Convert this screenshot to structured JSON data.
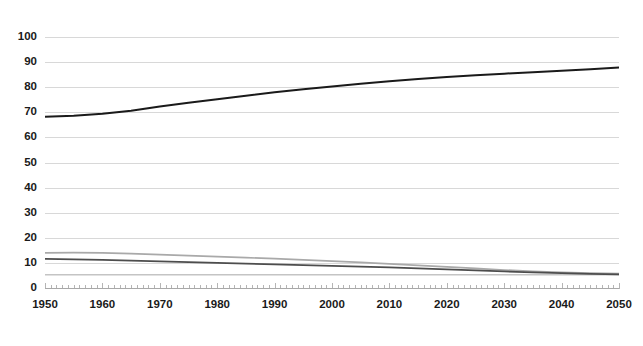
{
  "chart_data": {
    "type": "line",
    "title": "",
    "subtitle": "",
    "xlabel": "",
    "ylabel": "",
    "xlim": [
      1950,
      2050
    ],
    "ylim": [
      0,
      100
    ],
    "ytick_step": 10,
    "grid": true,
    "legend": "none",
    "y_ticks": [
      "0",
      "10",
      "20",
      "30",
      "40",
      "50",
      "60",
      "70",
      "80",
      "90",
      "100"
    ],
    "x_ticks": [
      "1950",
      "1960",
      "1970",
      "1980",
      "1990",
      "2000",
      "2010",
      "2020",
      "2030",
      "2040",
      "2050"
    ],
    "x": [
      1950,
      1955,
      1960,
      1965,
      1970,
      1975,
      1980,
      1985,
      1990,
      1995,
      2000,
      2005,
      2010,
      2015,
      2020,
      2025,
      2030,
      2035,
      2040,
      2045,
      2050
    ],
    "series": [
      {
        "name": "series-1",
        "color": "#1a1a1a",
        "width": 2.0,
        "values": [
          68.2,
          68.6,
          69.4,
          70.6,
          72.3,
          73.8,
          75.2,
          76.6,
          78.0,
          79.2,
          80.3,
          81.4,
          82.4,
          83.3,
          84.1,
          84.8,
          85.4,
          86.0,
          86.6,
          87.2,
          87.8
        ]
      },
      {
        "name": "series-2",
        "color": "#a9a9a9",
        "width": 1.6,
        "values": [
          14.0,
          14.1,
          14.0,
          13.7,
          13.3,
          12.9,
          12.5,
          12.1,
          11.7,
          11.2,
          10.7,
          10.2,
          9.6,
          9.0,
          8.4,
          7.8,
          7.2,
          6.7,
          6.3,
          6.0,
          5.8
        ]
      },
      {
        "name": "series-3",
        "color": "#4d4d4d",
        "width": 1.8,
        "values": [
          11.6,
          11.4,
          11.2,
          10.9,
          10.6,
          10.3,
          10.0,
          9.7,
          9.4,
          9.1,
          8.8,
          8.5,
          8.2,
          7.8,
          7.4,
          7.0,
          6.6,
          6.2,
          5.9,
          5.6,
          5.4
        ]
      },
      {
        "name": "series-4",
        "color": "#c4c4c4",
        "width": 1.6,
        "values": [
          5.3,
          5.3,
          5.3,
          5.3,
          5.3,
          5.3,
          5.3,
          5.3,
          5.3,
          5.3,
          5.3,
          5.3,
          5.3,
          5.3,
          5.3,
          5.3,
          5.3,
          5.3,
          5.3,
          5.3,
          5.3
        ]
      }
    ]
  },
  "plot": {
    "left": 45,
    "right": 619,
    "top": 37,
    "bottom": 288
  }
}
